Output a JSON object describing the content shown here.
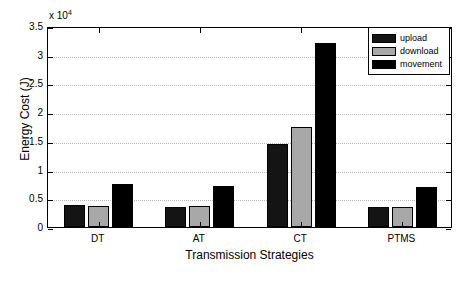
{
  "chart_data": {
    "type": "bar",
    "title": "",
    "xlabel": "Transmission Strategies",
    "ylabel": "Energy Cost (J)",
    "exponent_label": "x 10",
    "exponent_power": "4",
    "y_scale_multiplier": 10000,
    "categories": [
      "DT",
      "AT",
      "CT",
      "PTMS"
    ],
    "series": [
      {
        "name": "upload",
        "color": "#141414",
        "values": [
          3900,
          3500,
          14500,
          3400
        ]
      },
      {
        "name": "download",
        "color": "#a8a8a8",
        "values": [
          3700,
          3700,
          17500,
          3400
        ]
      },
      {
        "name": "movement",
        "color": "#000000",
        "values": [
          7500,
          7100,
          32000,
          7000
        ]
      }
    ],
    "ylim": [
      0,
      35000
    ],
    "ytick_values": [
      0,
      5000,
      10000,
      15000,
      20000,
      25000,
      30000,
      35000
    ],
    "ytick_labels": [
      "0",
      "0.5",
      "1",
      "1.5",
      "2",
      "2.5",
      "3",
      "3.5"
    ],
    "xtick_labels": [
      "DT",
      "AT",
      "CT",
      "PTMS"
    ],
    "grid": true,
    "grid_axis": "y",
    "legend_position": "top-right",
    "legend_entries": [
      "upload",
      "download",
      "movement"
    ]
  }
}
